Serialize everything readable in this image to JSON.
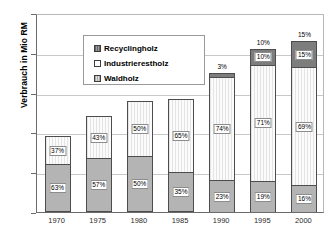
{
  "chart_data": {
    "type": "bar",
    "stacked": true,
    "title": "",
    "xlabel": "",
    "ylabel": "Verbrauch in Mio RM",
    "ylim": [
      0,
      25
    ],
    "yticks": [
      0,
      5,
      10,
      15,
      20,
      25
    ],
    "grid": true,
    "legend_position": "top-left",
    "categories": [
      "1970",
      "1975",
      "1980",
      "1985",
      "1990",
      "1995",
      "2000"
    ],
    "totals": [
      9.5,
      12,
      14,
      14.2,
      17.5,
      20.5,
      21.5
    ],
    "series": [
      {
        "name": "Waldholz",
        "color": "#b4b4b4",
        "values": [
          6.0,
          6.8,
          7.0,
          5.0,
          4.0,
          3.9,
          3.4
        ],
        "percent_labels": [
          "63%",
          "57%",
          "50%",
          "35%",
          "23%",
          "19%",
          "16%"
        ]
      },
      {
        "name": "Industrierestholz",
        "color": "#fbfbfb",
        "values": [
          3.5,
          5.2,
          7.0,
          9.2,
          13.0,
          14.6,
          14.8
        ],
        "percent_labels": [
          "37%",
          "43%",
          "50%",
          "65%",
          "74%",
          "71%",
          "69%"
        ]
      },
      {
        "name": "Recyclingholz",
        "color": "#7d7d7d",
        "values": [
          0,
          0,
          0,
          0,
          0.5,
          2.0,
          3.3
        ],
        "percent_labels": [
          "",
          "",
          "",
          "",
          "3%",
          "10%",
          "15%"
        ]
      }
    ]
  },
  "legend": {
    "items": [
      {
        "label": "Recyclingholz"
      },
      {
        "label": "Industrierestholz"
      },
      {
        "label": "Waldholz"
      }
    ]
  },
  "axis": {
    "y_title": "Verbrauch in Mio RM",
    "y_tick_labels": [
      "25",
      "20",
      "15",
      "10",
      "5",
      "0"
    ],
    "x_tick_labels": [
      "1970",
      "1975",
      "1980",
      "1985",
      "1990",
      "1995",
      "2000"
    ]
  }
}
